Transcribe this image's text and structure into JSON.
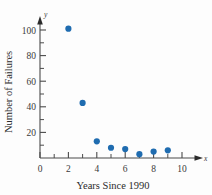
{
  "figure": {
    "background_color": "#fdfdfd",
    "axis_color": "#4a4a4a",
    "marker_color": "#1f6cb0",
    "x_axis_variable": "x",
    "y_axis_variable": "y"
  },
  "chart_data": {
    "type": "scatter",
    "title": "",
    "subtitle": "",
    "xlabel": "Years Since 1990",
    "ylabel": "Number of Failures",
    "x": [
      2,
      3,
      4,
      5,
      6,
      7,
      8,
      9
    ],
    "values": [
      101,
      43,
      13,
      8,
      7,
      3,
      5,
      6
    ],
    "series": [
      {
        "name": "Number of Failures",
        "points": [
          {
            "x": 2,
            "y": 101
          },
          {
            "x": 3,
            "y": 43
          },
          {
            "x": 4,
            "y": 13
          },
          {
            "x": 5,
            "y": 8
          },
          {
            "x": 6,
            "y": 7
          },
          {
            "x": 7,
            "y": 3
          },
          {
            "x": 8,
            "y": 5
          },
          {
            "x": 9,
            "y": 6
          }
        ]
      }
    ],
    "xlim": [
      0,
      11.2
    ],
    "ylim": [
      0,
      112
    ],
    "x_ticks": [
      0,
      2,
      4,
      6,
      8,
      10
    ],
    "x_tick_labels": [
      "0",
      "2",
      "4",
      "6",
      "8",
      "10"
    ],
    "x_minor_ticks": [
      1,
      3,
      5,
      7,
      9
    ],
    "y_ticks": [
      0,
      20,
      40,
      60,
      80,
      100
    ],
    "y_tick_labels": [
      "0",
      "20",
      "40",
      "60",
      "80",
      "100"
    ],
    "y_minor_ticks": [
      10,
      30,
      50,
      70,
      90
    ],
    "grid": false,
    "legend": null,
    "legend_position": "none",
    "annotations": []
  },
  "labels": {
    "y_axis_title": "Number of Failures",
    "x_axis_title": "Years Since 1990",
    "x_var": "x",
    "y_var": "y",
    "y_100": "100",
    "y_80": "80",
    "y_60": "60",
    "y_40": "40",
    "y_20": "20",
    "x_0": "0",
    "x_2": "2",
    "x_4": "4",
    "x_6": "6",
    "x_8": "8",
    "x_10": "10"
  }
}
